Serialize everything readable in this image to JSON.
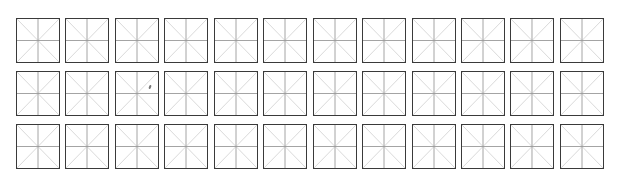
{
  "sheet": {
    "type": "mi-zi-ge calligraphy practice grid",
    "rows": 3,
    "columns": 12,
    "row_tops": [
      18,
      71,
      124
    ],
    "colors": {
      "border": "#3a3a3a",
      "center_lines": "#9a9a9a",
      "diagonal_lines": "#cfcfcf",
      "background": "#ffffff"
    },
    "marks": [
      {
        "row": 1,
        "col": 2,
        "description": "small pencil mark"
      }
    ]
  }
}
